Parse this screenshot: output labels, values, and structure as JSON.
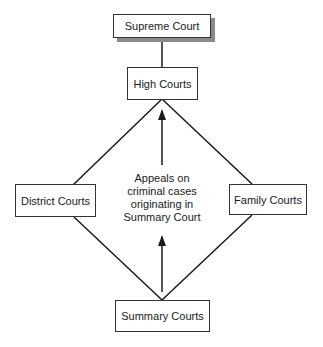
{
  "diagram": {
    "nodes": {
      "supreme": "Supreme Court",
      "high": "High Courts",
      "district": "District Courts",
      "family": "Family Courts",
      "summary": "Summary Courts"
    },
    "annotation": {
      "line1": "Appeals on",
      "line2": "criminal cases",
      "line3": "originating in",
      "line4": "Summary Court"
    },
    "edges": [
      {
        "from": "High Courts",
        "to": "Supreme Court",
        "type": "line"
      },
      {
        "from": "High Courts",
        "to": "District Courts",
        "type": "line"
      },
      {
        "from": "High Courts",
        "to": "Family Courts",
        "type": "line"
      },
      {
        "from": "District Courts",
        "to": "Summary Courts",
        "type": "line"
      },
      {
        "from": "Family Courts",
        "to": "Summary Courts",
        "type": "line"
      },
      {
        "from": "Summary Courts",
        "to": "High Courts",
        "type": "arrow",
        "label": "Appeals on criminal cases originating in Summary Court"
      }
    ],
    "colors": {
      "stroke": "#1a1a1a",
      "shadow": "#8a8a8a",
      "background": "#ffffff"
    }
  }
}
